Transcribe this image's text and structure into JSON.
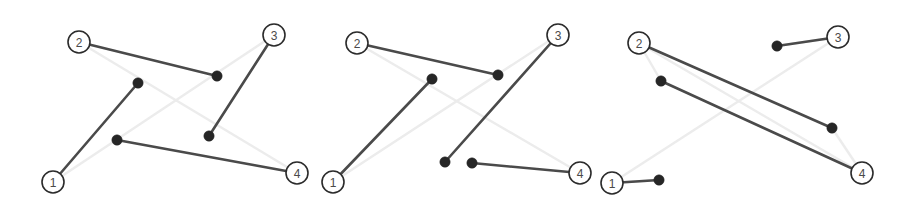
{
  "figure": {
    "background_color": "#ffffff",
    "panel_count": 3,
    "styles": {
      "active_edge_color": "#4a4a4a",
      "active_edge_width": 2.6,
      "faint_edge_color": "#ececec",
      "faint_edge_width": 2.4,
      "node_fill": "#ffffff",
      "node_stroke": "#2b2b2b",
      "node_radius": 11,
      "waypoint_color": "#262626",
      "waypoint_radius": 5.2,
      "label_color": "#4a4a4a"
    }
  },
  "panels": [
    {
      "id": "panel-1",
      "name": "left-panel",
      "nodes": [
        {
          "id": "n1",
          "label": "1",
          "x": 53,
          "y": 182
        },
        {
          "id": "n2",
          "label": "2",
          "x": 79,
          "y": 42
        },
        {
          "id": "n3",
          "label": "3",
          "x": 274,
          "y": 35
        },
        {
          "id": "n4",
          "label": "4",
          "x": 297,
          "y": 173
        }
      ],
      "waypoints": [
        {
          "id": "w1",
          "x": 138,
          "y": 83
        },
        {
          "id": "w2",
          "x": 217,
          "y": 76
        },
        {
          "id": "w3",
          "x": 117,
          "y": 140
        },
        {
          "id": "w4",
          "x": 209,
          "y": 136
        }
      ],
      "faint_edges": [
        {
          "from": "n2",
          "to": "n4"
        },
        {
          "from": "n1",
          "to": "n3"
        }
      ],
      "active_edges": [
        {
          "from": "n2",
          "to": "w2"
        },
        {
          "from": "n3",
          "to": "w4"
        },
        {
          "from": "n1",
          "to": "w1"
        },
        {
          "from": "w3",
          "to": "n4"
        }
      ]
    },
    {
      "id": "panel-2",
      "name": "middle-panel",
      "nodes": [
        {
          "id": "n1",
          "label": "1",
          "x": 333,
          "y": 182
        },
        {
          "id": "n2",
          "label": "2",
          "x": 357,
          "y": 43
        },
        {
          "id": "n3",
          "label": "3",
          "x": 558,
          "y": 35
        },
        {
          "id": "n4",
          "label": "4",
          "x": 580,
          "y": 173
        }
      ],
      "waypoints": [
        {
          "id": "w1",
          "x": 432,
          "y": 79
        },
        {
          "id": "w2",
          "x": 498,
          "y": 75
        },
        {
          "id": "w3",
          "x": 445,
          "y": 162
        },
        {
          "id": "w4",
          "x": 472,
          "y": 163
        }
      ],
      "faint_edges": [
        {
          "from": "n2",
          "to": "n4"
        },
        {
          "from": "n1",
          "to": "n3"
        }
      ],
      "active_edges": [
        {
          "from": "n2",
          "to": "w2"
        },
        {
          "from": "n3",
          "to": "w3"
        },
        {
          "from": "n1",
          "to": "w1"
        },
        {
          "from": "w4",
          "to": "n4"
        }
      ]
    },
    {
      "id": "panel-3",
      "name": "right-panel",
      "nodes": [
        {
          "id": "n1",
          "label": "1",
          "x": 612,
          "y": 183
        },
        {
          "id": "n2",
          "label": "2",
          "x": 639,
          "y": 43
        },
        {
          "id": "n3",
          "label": "3",
          "x": 838,
          "y": 37
        },
        {
          "id": "n4",
          "label": "4",
          "x": 862,
          "y": 173
        }
      ],
      "waypoints": [
        {
          "id": "w1",
          "x": 661,
          "y": 81
        },
        {
          "id": "w2",
          "x": 777,
          "y": 46
        },
        {
          "id": "w3",
          "x": 659,
          "y": 180
        },
        {
          "id": "w4",
          "x": 832,
          "y": 128
        }
      ],
      "faint_edges": [
        {
          "from": "n2",
          "to": "w1"
        },
        {
          "from": "n3",
          "to": "w2"
        },
        {
          "from": "n1",
          "to": "w3"
        },
        {
          "from": "n4",
          "to": "w4"
        },
        {
          "from": "n1",
          "to": "n3"
        },
        {
          "from": "n2",
          "to": "n4"
        }
      ],
      "active_edges": [
        {
          "from": "n2",
          "to": "w4"
        },
        {
          "from": "w1",
          "to": "n4"
        },
        {
          "from": "w2",
          "to": "n3"
        },
        {
          "from": "n1",
          "to": "w3"
        }
      ]
    }
  ]
}
